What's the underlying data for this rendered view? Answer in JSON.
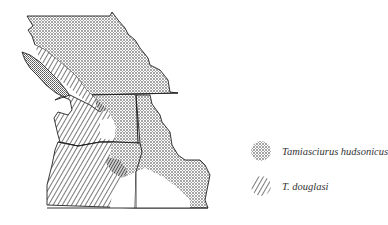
{
  "map": {
    "type": "range_map",
    "region": "Pacific Northwest (British Columbia, Washington, Oregon, Idaho)",
    "legend": [
      {
        "pattern": "stipple",
        "label": "Tamiasciurus hudsonicus",
        "color": "#999999"
      },
      {
        "pattern": "diagonal-hatch",
        "label": "T. douglasi",
        "color": "#222222"
      }
    ]
  }
}
